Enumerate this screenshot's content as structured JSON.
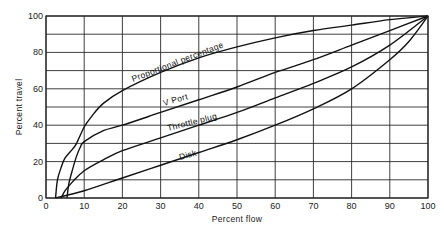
{
  "chart_data": {
    "type": "line",
    "title": "",
    "xlabel": "Percent flow",
    "ylabel": "Percent travel",
    "xlim": [
      0,
      100
    ],
    "ylim": [
      0,
      100
    ],
    "grid": true,
    "x_ticks": [
      0,
      10,
      20,
      30,
      40,
      50,
      60,
      70,
      80,
      90,
      100
    ],
    "y_ticks": [
      0,
      20,
      40,
      60,
      80,
      100
    ],
    "y_gridlines": [
      0,
      10,
      20,
      30,
      40,
      50,
      60,
      70,
      80,
      90,
      100
    ],
    "legend": "none (curves labeled inline)",
    "series": [
      {
        "name": "Proportional percentage",
        "points": [
          [
            2.5,
            0
          ],
          [
            3,
            10
          ],
          [
            4,
            17
          ],
          [
            5,
            22
          ],
          [
            7,
            27
          ],
          [
            8,
            30
          ],
          [
            10,
            39
          ],
          [
            12,
            45
          ],
          [
            15,
            52
          ],
          [
            20,
            59
          ],
          [
            30,
            69
          ],
          [
            40,
            77
          ],
          [
            50,
            83
          ],
          [
            60,
            88
          ],
          [
            70,
            92
          ],
          [
            80,
            95
          ],
          [
            90,
            98
          ],
          [
            100,
            100
          ]
        ]
      },
      {
        "name": "V Port",
        "points": [
          [
            5.5,
            0
          ],
          [
            6,
            8
          ],
          [
            7,
            16
          ],
          [
            8,
            23
          ],
          [
            9,
            28
          ],
          [
            10,
            31
          ],
          [
            15,
            37
          ],
          [
            20,
            40
          ],
          [
            30,
            47
          ],
          [
            40,
            54
          ],
          [
            50,
            61
          ],
          [
            60,
            69
          ],
          [
            70,
            76
          ],
          [
            80,
            84
          ],
          [
            90,
            92
          ],
          [
            100,
            100
          ]
        ]
      },
      {
        "name": "Throttle plug",
        "points": [
          [
            4,
            0
          ],
          [
            5,
            4
          ],
          [
            7,
            9
          ],
          [
            10,
            15
          ],
          [
            15,
            21
          ],
          [
            20,
            26
          ],
          [
            30,
            33
          ],
          [
            40,
            40
          ],
          [
            50,
            47
          ],
          [
            60,
            55
          ],
          [
            70,
            63
          ],
          [
            80,
            72
          ],
          [
            90,
            84
          ],
          [
            100,
            100
          ]
        ]
      },
      {
        "name": "Disk",
        "points": [
          [
            2.5,
            0
          ],
          [
            10,
            4
          ],
          [
            20,
            11
          ],
          [
            30,
            18
          ],
          [
            40,
            25
          ],
          [
            50,
            32
          ],
          [
            60,
            40
          ],
          [
            70,
            49
          ],
          [
            80,
            60
          ],
          [
            90,
            76
          ],
          [
            95,
            86
          ],
          [
            100,
            100
          ]
        ]
      }
    ],
    "annotations": [
      {
        "text": "Proportional percentage",
        "series": "Proportional percentage"
      },
      {
        "text": "V Port",
        "series": "V Port"
      },
      {
        "text": "Throttle plug",
        "series": "Throttle plug"
      },
      {
        "text": "Disk",
        "series": "Disk"
      }
    ]
  },
  "labels": {
    "xlabel": "Percent flow",
    "ylabel": "Percent travel",
    "curve_proportional": "Proportional percentage",
    "curve_vport": "V Port",
    "curve_throttle": "Throttle plug",
    "curve_disk": "Disk"
  }
}
